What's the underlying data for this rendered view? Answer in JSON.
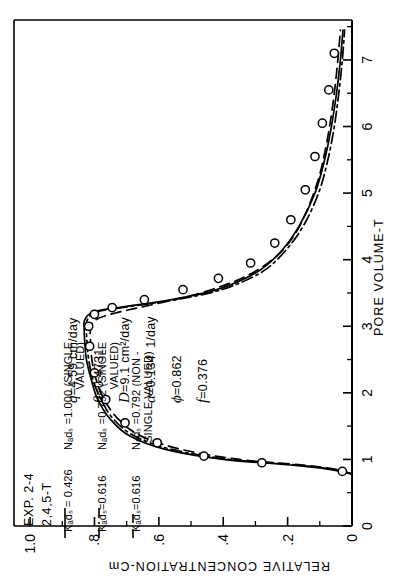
{
  "figure": {
    "exp_label": "EXP. 2-4",
    "compound_label": "2,4,5-T"
  },
  "legend": [
    {
      "style": "solid",
      "kads": "Kₐdₛ = 0.426",
      "nads": "Nₐdₛ =1.000 (SINGLE",
      "nads2": "VALUED)"
    },
    {
      "style": "dashdot",
      "kads": "Kₐdₛ=0.616",
      "nads": "Nₐdₛ =0.792 (SINGLE",
      "nads2": "VALUED)"
    },
    {
      "style": "dashed",
      "kads": "Kₐdₛ=0.616",
      "nads": "Nₐdₛ =0.792 (NON -",
      "nads2": "SINGLE VALUED)"
    }
  ],
  "parameters": [
    {
      "symbol": "q",
      "value": "=4.59 cm/day"
    },
    {
      "symbol": "θ",
      "value": "=0.4731"
    },
    {
      "symbol": "D",
      "value": "=9.1 cm²/day"
    },
    {
      "symbol": "α",
      "value": "=0.134  1/day"
    },
    {
      "symbol": "ϕ",
      "value": "=0.862"
    },
    {
      "symbol": "f",
      "value": "=0.376"
    }
  ],
  "chart_data": {
    "type": "line",
    "title": "",
    "xlabel": "PORE VOLUME-T",
    "ylabel": "RELATIVE CONCENTRATION-Cm",
    "xlim": [
      0,
      7.6
    ],
    "ylim": [
      0,
      1.05
    ],
    "xticks": [
      0,
      1,
      2,
      3,
      4,
      5,
      6,
      7
    ],
    "xticklabels": [
      "0",
      "1",
      "2",
      "3",
      "4",
      "5",
      "6",
      "7"
    ],
    "yticks": [
      0,
      0.2,
      0.4,
      0.6,
      0.8,
      1.0
    ],
    "yticklabels": [
      "0",
      ".2",
      ".4",
      ".6",
      ".8",
      "1.0"
    ],
    "grid": false,
    "legend_position": "top-left",
    "series": [
      {
        "name": "Kads=0.426, Nads=1.000 (single valued)",
        "style": "solid",
        "x": [
          0.78,
          0.85,
          0.92,
          1.0,
          1.15,
          1.35,
          1.6,
          1.9,
          2.2,
          2.5,
          2.75,
          2.95,
          3.1,
          3.22,
          3.3,
          3.4,
          3.55,
          3.8,
          4.1,
          4.5,
          5.0,
          5.5,
          6.0,
          6.5,
          7.0,
          7.45
        ],
        "y": [
          0.0,
          0.07,
          0.2,
          0.4,
          0.58,
          0.69,
          0.75,
          0.79,
          0.81,
          0.825,
          0.83,
          0.832,
          0.83,
          0.8,
          0.7,
          0.56,
          0.42,
          0.3,
          0.225,
          0.165,
          0.115,
          0.085,
          0.064,
          0.048,
          0.036,
          0.028
        ]
      },
      {
        "name": "Kads=0.616, Nads=0.792 (single valued)",
        "style": "dashdot",
        "x": [
          0.78,
          0.85,
          0.92,
          1.0,
          1.15,
          1.35,
          1.6,
          1.9,
          2.2,
          2.5,
          2.75,
          2.95,
          3.1,
          3.22,
          3.3,
          3.4,
          3.55,
          3.8,
          4.1,
          4.5,
          5.0,
          5.5,
          6.0,
          6.5,
          7.0,
          7.45
        ],
        "y": [
          0.0,
          0.06,
          0.18,
          0.38,
          0.56,
          0.675,
          0.74,
          0.78,
          0.805,
          0.818,
          0.823,
          0.825,
          0.822,
          0.79,
          0.685,
          0.545,
          0.405,
          0.285,
          0.213,
          0.152,
          0.104,
          0.075,
          0.055,
          0.041,
          0.03,
          0.023
        ]
      },
      {
        "name": "Kads=0.616, Nads=0.792 (non-single valued)",
        "style": "dashed",
        "x": [
          0.78,
          0.85,
          0.92,
          1.0,
          1.15,
          1.35,
          1.6,
          1.9,
          2.2,
          2.5,
          2.75,
          2.95,
          3.1,
          3.2,
          3.32,
          3.5,
          3.75,
          4.05,
          4.4,
          4.8,
          5.2,
          5.6,
          6.05,
          6.5,
          7.0,
          7.45
        ],
        "y": [
          0.0,
          0.05,
          0.16,
          0.35,
          0.53,
          0.655,
          0.725,
          0.77,
          0.795,
          0.808,
          0.812,
          0.812,
          0.795,
          0.735,
          0.625,
          0.47,
          0.33,
          0.235,
          0.175,
          0.135,
          0.105,
          0.085,
          0.068,
          0.055,
          0.044,
          0.036
        ]
      }
    ],
    "observed_points": {
      "name": "measured data",
      "marker": "open-circle",
      "x": [
        0.82,
        0.95,
        1.05,
        1.25,
        1.55,
        1.9,
        2.3,
        2.7,
        3.0,
        3.18,
        3.28,
        3.4,
        3.55,
        3.72,
        3.95,
        4.25,
        4.6,
        5.05,
        5.55,
        6.05,
        6.55,
        7.1
      ],
      "y": [
        0.03,
        0.28,
        0.46,
        0.605,
        0.705,
        0.765,
        0.8,
        0.815,
        0.818,
        0.8,
        0.745,
        0.645,
        0.525,
        0.415,
        0.315,
        0.24,
        0.19,
        0.145,
        0.115,
        0.092,
        0.072,
        0.055
      ]
    }
  }
}
